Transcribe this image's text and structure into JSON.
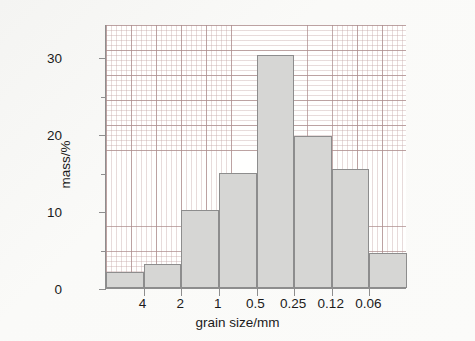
{
  "chart_data": {
    "type": "bar",
    "title": "",
    "subtitle": "",
    "xlabel": "grain size/mm",
    "ylabel": "mass/%",
    "grid": true,
    "legend": null,
    "ylim": [
      0,
      34.3
    ],
    "y_ticks_major": [
      0,
      10,
      20,
      30
    ],
    "y_ticks_minor": [
      5,
      15,
      25
    ],
    "y_tick_labels": [
      "0",
      "10",
      "20",
      "30"
    ],
    "x_tick_labels": [
      "4",
      "2",
      "1",
      "0.5",
      "0.25",
      "0.12",
      "0.06"
    ],
    "x_boundary_values": [
      4,
      2,
      1,
      0.5,
      0.25,
      0.12,
      0.06
    ],
    "categories": [
      ">4",
      "4-2",
      "2-1",
      "1-0.5",
      "0.5-0.25",
      "0.25-0.12",
      "0.12-0.06",
      "<0.06"
    ],
    "values": [
      2.1,
      3.1,
      10.2,
      14.9,
      30.3,
      19.8,
      15.4,
      4.5
    ],
    "bar_fill_color": "#d6d6d4",
    "bar_edge_color": "#8d8d8d",
    "axis_color": "#8e8e8e",
    "grid_color": "#c4a6a6",
    "background_color": "#f4f4f2",
    "plot_background_color": "#fffffe",
    "text_color": "#1b1b1b"
  },
  "axes": {
    "y_title": "mass/%",
    "x_title": "grain size/mm"
  }
}
